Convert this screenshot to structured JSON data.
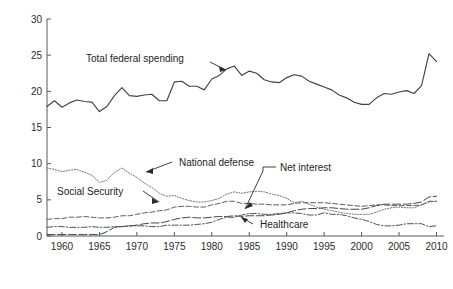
{
  "chart_data": {
    "type": "line",
    "title": "",
    "xlabel": "Year",
    "ylabel": "Federal Spending (as percentage of GDP)",
    "xlim": [
      1958,
      2011
    ],
    "ylim": [
      0,
      30
    ],
    "xticks": [
      1960,
      1965,
      1970,
      1975,
      1980,
      1985,
      1990,
      1995,
      2000,
      2005,
      2010
    ],
    "yticks": [
      0,
      5,
      10,
      15,
      20,
      25,
      30
    ],
    "grid": false,
    "legend_position": "inline-annotations",
    "x": [
      1958,
      1959,
      1960,
      1961,
      1962,
      1963,
      1964,
      1965,
      1966,
      1967,
      1968,
      1969,
      1970,
      1971,
      1972,
      1973,
      1974,
      1975,
      1976,
      1977,
      1978,
      1979,
      1980,
      1981,
      1982,
      1983,
      1984,
      1985,
      1986,
      1987,
      1988,
      1989,
      1990,
      1991,
      1992,
      1993,
      1994,
      1995,
      1996,
      1997,
      1998,
      1999,
      2000,
      2001,
      2002,
      2003,
      2004,
      2005,
      2006,
      2007,
      2008,
      2009,
      2010
    ],
    "series": [
      {
        "name": "Total federal spending",
        "style": "solid",
        "color": "#3f4447",
        "values": [
          17.9,
          18.7,
          17.8,
          18.4,
          18.8,
          18.6,
          18.5,
          17.2,
          17.9,
          19.4,
          20.5,
          19.4,
          19.3,
          19.5,
          19.6,
          18.7,
          18.7,
          21.3,
          21.4,
          20.7,
          20.7,
          20.2,
          21.7,
          22.2,
          23.1,
          23.5,
          22.2,
          22.8,
          22.5,
          21.6,
          21.3,
          21.2,
          21.9,
          22.3,
          22.1,
          21.4,
          21.0,
          20.6,
          20.2,
          19.5,
          19.1,
          18.5,
          18.2,
          18.2,
          19.1,
          19.7,
          19.6,
          19.9,
          20.1,
          19.7,
          20.8,
          25.2,
          24.1
        ]
      },
      {
        "name": "National defense",
        "style": "dotted",
        "color": "#6e7478",
        "values": [
          9.4,
          9.2,
          8.9,
          9.1,
          9.2,
          8.8,
          8.4,
          7.4,
          7.7,
          8.8,
          9.4,
          8.7,
          8.1,
          7.3,
          6.7,
          5.9,
          5.5,
          5.6,
          5.2,
          4.9,
          4.7,
          4.7,
          4.9,
          5.2,
          5.8,
          6.1,
          5.9,
          6.1,
          6.2,
          6.1,
          5.8,
          5.6,
          5.2,
          4.6,
          4.8,
          4.4,
          4.0,
          3.7,
          3.5,
          3.3,
          3.1,
          3.0,
          3.0,
          3.0,
          3.3,
          3.7,
          3.9,
          4.0,
          3.9,
          3.9,
          4.3,
          4.7,
          4.8
        ]
      },
      {
        "name": "Social Security",
        "style": "dashed",
        "color": "#5a5f63",
        "values": [
          2.3,
          2.4,
          2.4,
          2.6,
          2.6,
          2.7,
          2.6,
          2.5,
          2.5,
          2.6,
          2.8,
          2.8,
          3.0,
          3.2,
          3.3,
          3.5,
          3.6,
          4.0,
          4.1,
          4.1,
          4.0,
          4.0,
          4.3,
          4.5,
          4.8,
          4.8,
          4.5,
          4.5,
          4.4,
          4.4,
          4.3,
          4.3,
          4.3,
          4.5,
          4.6,
          4.6,
          4.6,
          4.6,
          4.5,
          4.4,
          4.3,
          4.2,
          4.1,
          4.2,
          4.3,
          4.3,
          4.2,
          4.2,
          4.2,
          4.2,
          4.3,
          4.8,
          4.8
        ]
      },
      {
        "name": "Net interest",
        "style": "dashdot",
        "color": "#4d5255",
        "values": [
          1.2,
          1.3,
          1.3,
          1.2,
          1.2,
          1.2,
          1.3,
          1.2,
          1.2,
          1.3,
          1.3,
          1.4,
          1.4,
          1.4,
          1.3,
          1.3,
          1.5,
          1.5,
          1.5,
          1.5,
          1.6,
          1.7,
          1.9,
          2.3,
          2.6,
          2.6,
          2.9,
          3.1,
          3.1,
          3.0,
          3.0,
          3.1,
          3.2,
          3.2,
          3.1,
          2.9,
          2.9,
          3.2,
          3.0,
          3.0,
          2.8,
          2.5,
          2.3,
          2.0,
          1.6,
          1.4,
          1.4,
          1.5,
          1.7,
          1.7,
          1.7,
          1.3,
          1.4
        ]
      },
      {
        "name": "Healthcare",
        "style": "longdash",
        "color": "#44494c",
        "values": [
          0.2,
          0.2,
          0.2,
          0.2,
          0.2,
          0.2,
          0.2,
          0.2,
          0.6,
          1.2,
          1.3,
          1.4,
          1.5,
          1.7,
          1.8,
          1.8,
          2.0,
          2.3,
          2.5,
          2.6,
          2.5,
          2.5,
          2.6,
          2.7,
          2.7,
          2.8,
          2.7,
          2.8,
          2.8,
          2.8,
          2.9,
          3.0,
          3.2,
          3.5,
          3.7,
          3.8,
          3.8,
          3.9,
          3.9,
          3.8,
          3.7,
          3.7,
          3.7,
          3.9,
          4.2,
          4.4,
          4.4,
          4.4,
          4.4,
          4.5,
          4.7,
          5.4,
          5.5
        ]
      }
    ],
    "annotations": [
      {
        "id": "total-federal-spending",
        "label": "Total federal spending"
      },
      {
        "id": "national-defense",
        "label": "National defense"
      },
      {
        "id": "social-security",
        "label": "Social Security"
      },
      {
        "id": "net-interest",
        "label": "Net interest"
      },
      {
        "id": "healthcare",
        "label": "Healthcare"
      }
    ]
  }
}
